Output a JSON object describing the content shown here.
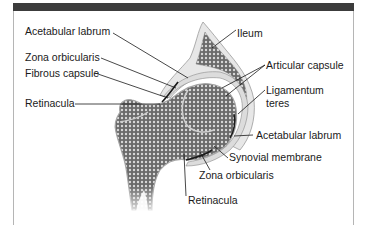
{
  "figure": {
    "header_bar_color": "#3c3c3c",
    "labels_left": [
      {
        "id": "acetabular-labrum-top",
        "text": "Acetabular labrum"
      },
      {
        "id": "zona-orbicularis-top",
        "text": "Zona orbicularis"
      },
      {
        "id": "fibrous-capsule",
        "text": "Fibrous capsule"
      },
      {
        "id": "retinacula-top",
        "text": "Retinacula"
      }
    ],
    "labels_right": [
      {
        "id": "ileum",
        "text": "Ileum"
      },
      {
        "id": "articular-capsule",
        "text": "Articular capsule"
      },
      {
        "id": "ligamentum-teres-1",
        "text": "Ligamentum"
      },
      {
        "id": "ligamentum-teres-2",
        "text": "teres"
      },
      {
        "id": "acetabular-labrum-bottom",
        "text": "Acetabular labrum"
      },
      {
        "id": "synovial-membrane",
        "text": "Synovial membrane"
      },
      {
        "id": "zona-orbicularis-bottom",
        "text": "Zona orbicularis"
      },
      {
        "id": "retinacula-bottom",
        "text": "Retinacula"
      }
    ]
  }
}
